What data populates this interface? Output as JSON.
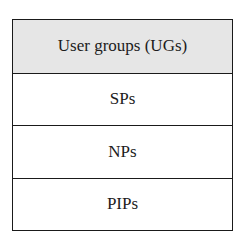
{
  "diagram": {
    "header": {
      "label": "User groups (UGs)",
      "fill": "#e6e6e6"
    },
    "rows": [
      {
        "label": "SPs"
      },
      {
        "label": "NPs"
      },
      {
        "label": "PIPs"
      }
    ]
  }
}
